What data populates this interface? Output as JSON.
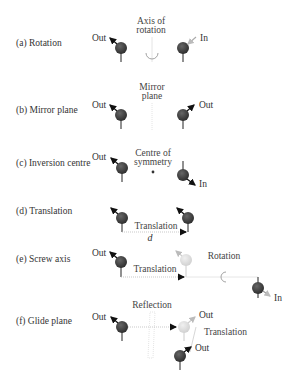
{
  "panels": [
    {
      "id": "a",
      "label": "(a) Rotation",
      "element_label": "Axis of",
      "element_label2": "rotation",
      "left_arrow": "Out",
      "right_arrow": "In"
    },
    {
      "id": "b",
      "label": "(b) Mirror plane",
      "element_label": "Mirror",
      "element_label2": "plane",
      "left_arrow": "Out",
      "right_arrow": "Out"
    },
    {
      "id": "c",
      "label": "(c) Inversion centre",
      "element_label": "Centre of",
      "element_label2": "symmetry",
      "left_arrow": "Out",
      "right_arrow": "In"
    },
    {
      "id": "d",
      "label": "(d) Translation",
      "operation_label": "Translation",
      "distance_label": "d"
    },
    {
      "id": "e",
      "label": "(e) Screw axis",
      "left_arrow": "Out",
      "operation_label": "Translation",
      "rotation_label": "Rotation",
      "right_arrow": "In"
    },
    {
      "id": "f",
      "label": "(f) Glide plane",
      "left_arrow": "Out",
      "reflection_label": "Reflection",
      "ghost_arrow": "Out",
      "translation_label": "Translation",
      "final_arrow": "Out"
    }
  ],
  "colors": {
    "atom": "#3a3a3a",
    "ghost": "#d8d8d8",
    "line": "#222222",
    "faint": "#c8c8c8"
  }
}
